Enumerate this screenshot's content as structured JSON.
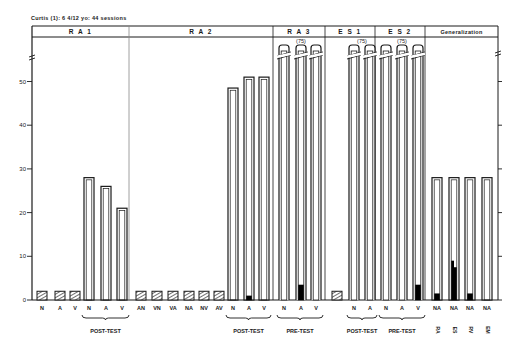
{
  "caption": "Curtis (1): 6 4/12 yo: 44 sessions",
  "chart_data": {
    "type": "bar",
    "title": "Curtis (1): 6 4/12 yo: 44 sessions",
    "xlabel": "",
    "ylabel": "",
    "ylim": [
      0,
      58
    ],
    "yticks": [
      0,
      10,
      20,
      30,
      40,
      50
    ],
    "grid": false,
    "axis_break_top": true,
    "legend": {
      "hatched": "baseline/training phase (hatched)",
      "open": "outline bar",
      "black_fill": "filled portion"
    },
    "panels": [
      {
        "label": "RA 1",
        "bars": [
          {
            "x": "N",
            "value": 2,
            "style": "hatched"
          },
          {
            "x": "A",
            "value": 2,
            "style": "hatched"
          },
          {
            "x": "V",
            "value": 2,
            "style": "hatched"
          },
          {
            "x": "N",
            "value": 28,
            "style": "open",
            "group": "POST-TEST"
          },
          {
            "x": "A",
            "value": 26,
            "style": "open",
            "group": "POST-TEST"
          },
          {
            "x": "V",
            "value": 21,
            "style": "open",
            "group": "POST-TEST"
          }
        ],
        "groups": [
          "POST-TEST"
        ]
      },
      {
        "label": "R A 2",
        "bars": [
          {
            "x": "AN",
            "value": 2,
            "style": "hatched"
          },
          {
            "x": "VN",
            "value": 2,
            "style": "hatched"
          },
          {
            "x": "VA",
            "value": 2,
            "style": "hatched"
          },
          {
            "x": "NA",
            "value": 2,
            "style": "hatched"
          },
          {
            "x": "NV",
            "value": 2,
            "style": "hatched"
          },
          {
            "x": "AV",
            "value": 2,
            "style": "hatched"
          },
          {
            "x": "N",
            "value": 48.5,
            "filled": 0,
            "style": "open",
            "group": "POST-TEST"
          },
          {
            "x": "A",
            "value": 51,
            "filled": 1,
            "style": "open",
            "group": "POST-TEST"
          },
          {
            "x": "V",
            "value": 51,
            "filled": 0,
            "style": "open",
            "group": "POST-TEST"
          }
        ],
        "groups": [
          "POST-TEST"
        ]
      },
      {
        "label": "R A 3",
        "annotation": "(75)",
        "bars": [
          {
            "x": "N",
            "value": 75,
            "filled": 0,
            "style": "open",
            "broken": true,
            "group": "PRE-TEST"
          },
          {
            "x": "A",
            "value": 75,
            "filled": 3.5,
            "style": "open",
            "broken": true,
            "group": "PRE-TEST"
          },
          {
            "x": "V",
            "value": 75,
            "filled": 0,
            "style": "open",
            "broken": true,
            "group": "PRE-TEST"
          }
        ],
        "groups": [
          "PRE-TEST"
        ]
      },
      {
        "label": "E S 1",
        "annotation": "(75)",
        "bars": [
          {
            "x": "",
            "value": 2,
            "style": "hatched"
          },
          {
            "x": "N",
            "value": 75,
            "filled": 0,
            "style": "open",
            "broken": true,
            "group": "POST-TEST"
          },
          {
            "x": "A",
            "value": 75,
            "filled": 0,
            "style": "open",
            "broken": true,
            "group": "POST-TEST"
          }
        ],
        "groups": [
          "POST-TEST"
        ]
      },
      {
        "label": "E S 2",
        "annotation": "(75)",
        "bars": [
          {
            "x": "N",
            "value": 75,
            "filled": 0,
            "style": "open",
            "broken": true,
            "group": "PRE-TEST"
          },
          {
            "x": "A",
            "value": 75,
            "filled": 0,
            "style": "open",
            "broken": true,
            "group": "PRE-TEST"
          },
          {
            "x": "V",
            "value": 75,
            "filled": 3.5,
            "style": "open",
            "broken": true,
            "group": "PRE-TEST"
          }
        ],
        "groups": [
          "PRE-TEST"
        ]
      },
      {
        "label": "Generalization",
        "bars": [
          {
            "x": "NA",
            "sublabel": "RA",
            "value": 28,
            "filled": 1.5,
            "style": "open"
          },
          {
            "x": "NA",
            "sublabel": "ES",
            "value": 28,
            "filled": 9,
            "filled_step": 7.5,
            "style": "open"
          },
          {
            "x": "NA",
            "sublabel": "RV",
            "value": 28,
            "filled": 1.5,
            "style": "open"
          },
          {
            "x": "NA",
            "sublabel": "EM",
            "value": 28,
            "filled": 0,
            "style": "open"
          }
        ]
      }
    ]
  },
  "panels": {
    "ra1": {
      "label": "R A 1",
      "post_test": "POST-TEST",
      "x": [
        "N",
        "A",
        "V",
        "N",
        "A",
        "V"
      ]
    },
    "ra2": {
      "label": "R A 2",
      "post_test": "POST-TEST",
      "x": [
        "AN",
        "VN",
        "VA",
        "NA",
        "NV",
        "AV",
        "N",
        "A",
        "V"
      ]
    },
    "ra3": {
      "label": "R A 3",
      "annotation": "(75)",
      "pre_test": "PRE-TEST",
      "x": [
        "N",
        "A",
        "V"
      ]
    },
    "es1": {
      "label": "E S 1",
      "annotation": "(75)",
      "post_test": "POST-TEST",
      "x": [
        "N",
        "A"
      ]
    },
    "es2": {
      "label": "E S 2",
      "annotation": "(75)",
      "pre_test": "PRE-TEST",
      "x": [
        "N",
        "A",
        "V"
      ]
    },
    "gen": {
      "label": "Generalization",
      "x": [
        "NA",
        "NA",
        "NA",
        "NA"
      ],
      "sub": [
        "RA",
        "ES",
        "RV",
        "EM"
      ]
    }
  },
  "yticks": [
    "0",
    "10",
    "20",
    "30",
    "40",
    "50"
  ]
}
